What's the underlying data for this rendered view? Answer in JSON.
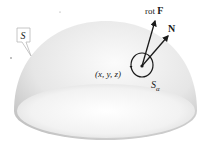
{
  "figure": {
    "surface_label": "S",
    "curl_label_prefix": "rot ",
    "curl_label_vector": "F",
    "normal_label": "N",
    "point_label": "(x, y, z)",
    "disk_label_main": "S",
    "disk_label_sub": "α"
  },
  "colors": {
    "surface_light": "#f4f4f4",
    "surface_dark": "#c8c8c8",
    "ink": "#1a1a1a"
  }
}
